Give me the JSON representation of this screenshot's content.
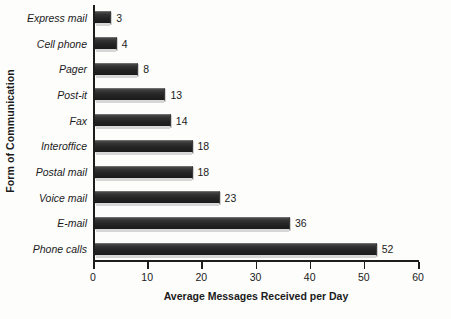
{
  "chart_data": {
    "type": "bar",
    "orientation": "horizontal",
    "title": "",
    "xlabel": "Average Messages Received per Day",
    "ylabel": "Form of Communication",
    "categories": [
      "Express mail",
      "Cell phone",
      "Pager",
      "Post-it",
      "Fax",
      "Interoffice",
      "Postal mail",
      "Voice mail",
      "E-mail",
      "Phone calls"
    ],
    "values": [
      3,
      4,
      8,
      13,
      14,
      18,
      18,
      23,
      36,
      52
    ],
    "value_labels": [
      "3",
      "4",
      "8",
      "13",
      "14",
      "18",
      "18",
      "23",
      "36",
      "52"
    ],
    "xlim": [
      0,
      60
    ],
    "xticks": [
      0,
      10,
      20,
      30,
      40,
      50,
      60
    ],
    "xtick_labels": [
      "0",
      "10",
      "20",
      "30",
      "40",
      "50",
      "60"
    ],
    "grid": false,
    "legend": false,
    "bar_color": "#262626",
    "background_color": "#fdfdfb",
    "axis_color": "#1d1d1d"
  }
}
